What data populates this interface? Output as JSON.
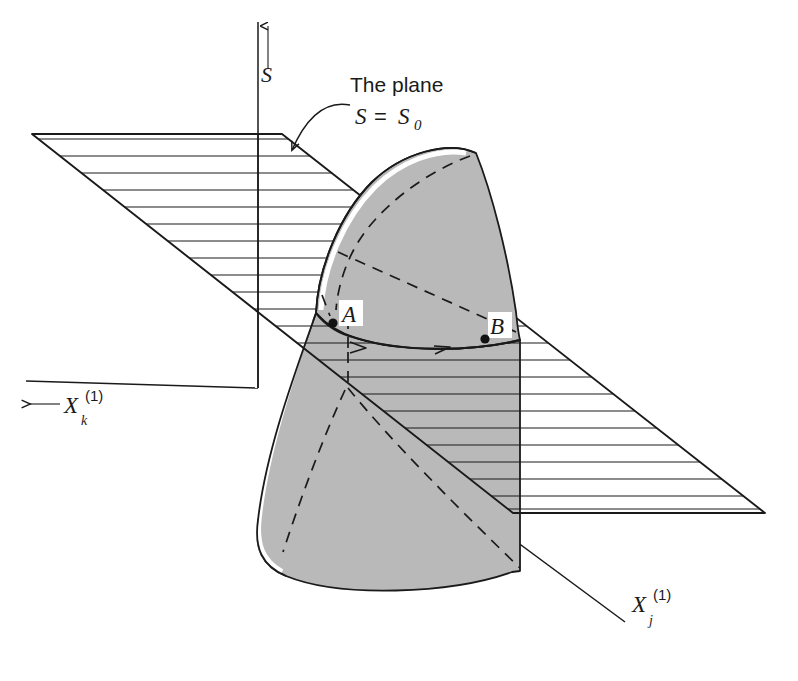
{
  "figure": {
    "type": "3d-surface-plane-intersection-diagram",
    "background_color": "#ffffff",
    "ink_color": "#1a1a1a",
    "surface_fill_color": "#b9b9b9",
    "highlight_color": "#ffffff"
  },
  "axes": {
    "vertical": {
      "name": "S",
      "label": "S",
      "arrow_direction": "up"
    },
    "left": {
      "name": "X_k^(1)",
      "label_base": "X",
      "label_sub": "k",
      "label_sup": "(1)",
      "arrow_direction": "left",
      "arrow_glyph": "←"
    },
    "right": {
      "name": "X_j^(1)",
      "label_base": "X",
      "label_sub": "j",
      "label_sup": "(1)",
      "arrow_direction": "none"
    }
  },
  "annotations": {
    "plane_label_line1": "The plane",
    "plane_label_line2_lhs": "S",
    "plane_label_line2_eq": "=",
    "plane_label_line2_rhs": "S",
    "plane_label_line2_rhs_sub": "0",
    "leader": "curved-arrow-to-plane"
  },
  "points": [
    {
      "id": "A",
      "label": "A",
      "x": 333,
      "y": 323
    },
    {
      "id": "B",
      "label": "B",
      "x": 485,
      "y": 339
    }
  ],
  "path": {
    "name": "trajectory-A-to-B",
    "direction": "left-to-right",
    "arrowhead_count": 2
  },
  "plane": {
    "name": "S = S0 plane",
    "hatch_style": "horizontal-lines",
    "hatch_spacing_px": 17,
    "corners": [
      [
        32,
        134
      ],
      [
        282,
        134
      ],
      [
        765,
        513
      ],
      [
        513,
        513
      ]
    ]
  },
  "surface": {
    "name": "response-surface",
    "shading": "halftone-gray",
    "contours": "dashed-meridians"
  }
}
